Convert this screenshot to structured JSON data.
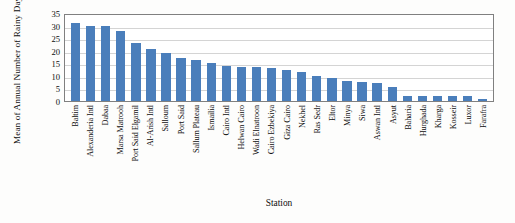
{
  "chart_data": {
    "type": "bar",
    "title": "",
    "xlabel": "Station",
    "ylabel": "Mean of Annual Number of Rainy Days (day)",
    "ylim": [
      0,
      35
    ],
    "yticks": [
      0,
      5,
      10,
      15,
      20,
      25,
      30,
      35
    ],
    "grid": true,
    "legend": false,
    "bar_color": "#4a7ebb",
    "categories": [
      "Baltim",
      "Alexanderia Intl",
      "Dabaa",
      "Marsa Matrooh",
      "Port Said Elgamil",
      "Al-Arish Intl",
      "Salloum",
      "Port Said",
      "Sallum Plateau",
      "Ismailia",
      "Cairo Intl",
      "Helwan Cairo",
      "Wadi Elnatroon",
      "Cairo Ezbekiya",
      "Giza Cairo",
      "Nekhel",
      "Ras Sedr",
      "Eltor",
      "Minya",
      "Siwa",
      "Aswan Intl",
      "Asyut",
      "Baharia",
      "Hurghada",
      "Kharga",
      "Kosseir",
      "Luxor",
      "Farafra"
    ],
    "values": [
      31,
      30,
      30,
      28,
      23,
      20.5,
      19,
      17,
      16.5,
      15,
      14,
      13.5,
      13.5,
      13,
      12.5,
      11.5,
      10,
      9,
      8,
      7.5,
      7,
      5.5,
      2,
      2,
      2,
      2,
      2,
      1
    ]
  }
}
